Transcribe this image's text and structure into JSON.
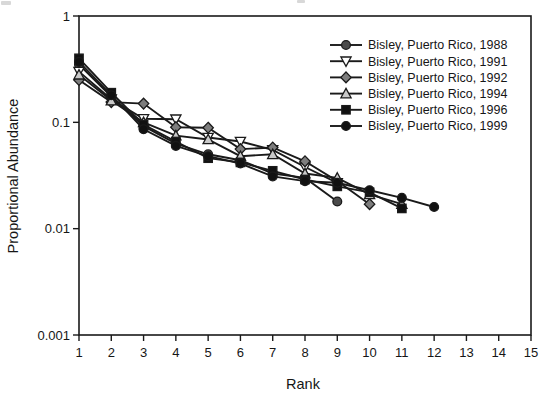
{
  "chart_data": {
    "type": "line",
    "title": "",
    "xlabel": "Rank",
    "ylabel": "Proportional Abundance",
    "x_scale": "linear",
    "y_scale": "log",
    "xlim": [
      1,
      15
    ],
    "ylim": [
      0.001,
      1
    ],
    "x_ticks": [
      1,
      2,
      3,
      4,
      5,
      6,
      7,
      8,
      9,
      10,
      11,
      12,
      13,
      14,
      15
    ],
    "y_ticks": [
      1,
      0.1,
      0.01,
      0.001
    ],
    "y_tick_labels": [
      "1",
      "0.1",
      "0.01",
      "0.001"
    ],
    "grid": false,
    "frame": "box",
    "legend_position": "top-right-inside",
    "axis_color": "#1a1a1a",
    "line_color": "#1a1a1a",
    "marker_outline": "#1a1a1a",
    "series": [
      {
        "name": "Bisley, Puerto Rico, 1988",
        "marker": "circle",
        "fill": "#4a4a4a",
        "x": [
          1,
          2,
          3,
          4,
          5,
          6,
          7,
          8,
          9
        ],
        "values": [
          0.35,
          0.175,
          0.092,
          0.063,
          0.05,
          0.044,
          0.033,
          0.03,
          0.018
        ]
      },
      {
        "name": "Bisley, Puerto Rico, 1991",
        "marker": "triangle-down",
        "fill": "#ffffff",
        "x": [
          1,
          2,
          3,
          4,
          5,
          6,
          7,
          8,
          9
        ],
        "values": [
          0.3,
          0.165,
          0.108,
          0.107,
          0.072,
          0.066,
          0.055,
          0.038,
          0.027
        ]
      },
      {
        "name": "Bisley, Puerto Rico, 1992",
        "marker": "diamond",
        "fill": "#7d7d7d",
        "x": [
          1,
          2,
          3,
          4,
          5,
          6,
          7,
          8,
          9,
          10
        ],
        "values": [
          0.25,
          0.155,
          0.15,
          0.09,
          0.089,
          0.056,
          0.058,
          0.043,
          0.028,
          0.017
        ]
      },
      {
        "name": "Bisley, Puerto Rico, 1994",
        "marker": "triangle-up",
        "fill": "#c9c9c9",
        "x": [
          1,
          2,
          3,
          4,
          5,
          6,
          7,
          8,
          9,
          10,
          11
        ],
        "values": [
          0.28,
          0.16,
          0.1,
          0.075,
          0.069,
          0.048,
          0.05,
          0.033,
          0.03,
          0.021,
          0.017
        ]
      },
      {
        "name": "Bisley, Puerto Rico, 1996",
        "marker": "square",
        "fill": "#111111",
        "x": [
          1,
          2,
          3,
          4,
          5,
          6,
          7,
          8,
          9,
          10,
          11
        ],
        "values": [
          0.4,
          0.19,
          0.095,
          0.066,
          0.046,
          0.042,
          0.035,
          0.029,
          0.025,
          0.022,
          0.0155
        ]
      },
      {
        "name": "Bisley, Puerto Rico, 1999",
        "marker": "circle",
        "fill": "#111111",
        "x": [
          1,
          2,
          3,
          4,
          5,
          6,
          7,
          8,
          9,
          10,
          11,
          12
        ],
        "values": [
          0.37,
          0.18,
          0.086,
          0.06,
          0.048,
          0.041,
          0.031,
          0.028,
          0.027,
          0.023,
          0.0195,
          0.016
        ]
      }
    ]
  }
}
